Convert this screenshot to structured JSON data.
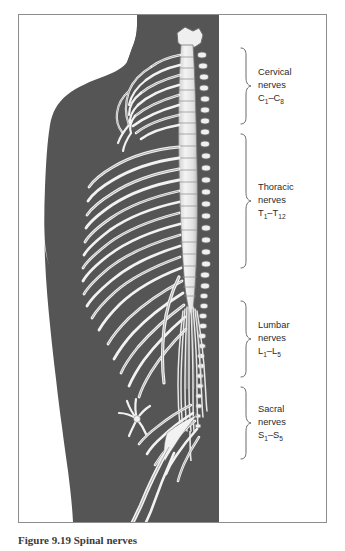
{
  "figure": {
    "caption": "Figure 9.19  Spinal nerves",
    "background_color": "#ffffff",
    "frame_color": "#8d8d8d",
    "body_silhouette_color": "#555555",
    "nerve_color": "#f2f2f2",
    "nerve_outline_color": "#6b6b6b",
    "cord_color": "#e9e9e9",
    "text_color": "#2b2b2b"
  },
  "labels": [
    {
      "id": "cervical",
      "region": "Cervical",
      "line1": "Cervical",
      "line2": "nerves",
      "range_prefix": "C",
      "range_from_sub": "1",
      "range_dash": "–",
      "range_to_prefix": "C",
      "range_to_sub": "8",
      "range_full": "C1–C8",
      "brace_top": 47,
      "brace_bottom": 125
    },
    {
      "id": "thoracic",
      "region": "Thoracic",
      "line1": "Thoracic",
      "line2": "nerves",
      "range_prefix": "T",
      "range_from_sub": "1",
      "range_dash": "–",
      "range_to_prefix": "T",
      "range_to_sub": "12",
      "range_full": "T1–T12",
      "brace_top": 133,
      "brace_bottom": 293
    },
    {
      "id": "lumbar",
      "region": "Lumbar",
      "line1": "Lumbar",
      "line2": "nerves",
      "range_prefix": "L",
      "range_from_sub": "1",
      "range_dash": "–",
      "range_to_prefix": "L",
      "range_to_sub": "5",
      "range_full": "L1–L5",
      "brace_top": 300,
      "brace_bottom": 378
    },
    {
      "id": "sacral",
      "region": "Sacral",
      "line1": "Sacral",
      "line2": "nerves",
      "range_prefix": "S",
      "range_from_sub": "1",
      "range_dash": "–",
      "range_to_prefix": "S",
      "range_to_sub": "5",
      "range_full": "S1–S5",
      "brace_top": 386,
      "brace_bottom": 462
    }
  ],
  "anatomy": {
    "structures": [
      "body-silhouette",
      "head-profile",
      "spinal-cord",
      "vertebral-column",
      "cervical-nerve-roots",
      "brachial-plexus",
      "thoracic-intercostal-nerves",
      "lumbar-nerve-roots",
      "cauda-equina",
      "sacral-plexus",
      "sciatic-nerve"
    ],
    "counts": {
      "cervical_pairs": 8,
      "thoracic_pairs": 12,
      "lumbar_pairs": 5,
      "sacral_pairs": 5
    }
  }
}
